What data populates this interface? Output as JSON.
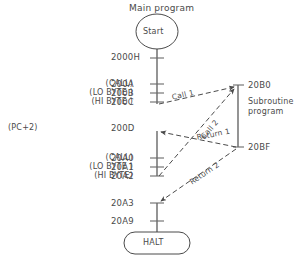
{
  "diagram": {
    "title": "Main program",
    "subroutine_title_line1": "Subroutine",
    "subroutine_title_line2": "program",
    "start_node": "Start",
    "end_node": "HALT",
    "pc_label": "(PC+2)",
    "main_rows": [
      {
        "mnemonic": "",
        "address": "2000H"
      },
      {
        "mnemonic": "(CALL)",
        "address": "200A"
      },
      {
        "mnemonic": "(LO BYTE )",
        "address": "200B"
      },
      {
        "mnemonic": "(HI BYTE )",
        "address": "200C"
      },
      {
        "mnemonic": "",
        "address": "200D"
      },
      {
        "mnemonic": "(CALL)",
        "address": "20A0"
      },
      {
        "mnemonic": "(LO BYTE )",
        "address": "20A1"
      },
      {
        "mnemonic": "(HI BYTE)",
        "address": "20A2"
      },
      {
        "mnemonic": "",
        "address": "20A3"
      },
      {
        "mnemonic": "",
        "address": "20A9"
      }
    ],
    "subroutine_rows": [
      {
        "address": "20B0"
      },
      {
        "address": "20BF"
      }
    ],
    "edges": [
      {
        "label": "Call 1"
      },
      {
        "label": "Call 2"
      },
      {
        "label": "Return 1"
      },
      {
        "label": "Return 2"
      }
    ],
    "colors": {
      "line": "#555555",
      "text": "#4a4a4a",
      "background": "#ffffff"
    }
  }
}
